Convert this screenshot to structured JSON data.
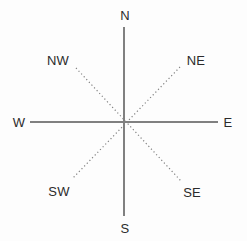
{
  "figure": {
    "name": "compass-rose",
    "background_color": "#fdfdfd",
    "line_color": "#808080",
    "label_color": "#2b2b2b",
    "width": 247,
    "height": 241,
    "center": {
      "x": 124,
      "y": 122
    }
  },
  "axes": [
    {
      "id": "north-south-axis",
      "style": "solid",
      "color": "#808080",
      "width": 1,
      "x1": 124,
      "y1": 27,
      "x2": 124,
      "y2": 216
    },
    {
      "id": "west-east-axis",
      "style": "solid",
      "color": "#808080",
      "width": 1,
      "x1": 30,
      "y1": 122,
      "x2": 218,
      "y2": 122
    },
    {
      "id": "northwest-southeast-axis",
      "style": "dotted",
      "color": "#808080",
      "width": 1,
      "x1": 76,
      "y1": 68,
      "x2": 181,
      "y2": 181
    },
    {
      "id": "northeast-southwest-axis",
      "style": "dotted",
      "color": "#808080",
      "width": 1,
      "x1": 180,
      "y1": 67,
      "x2": 72,
      "y2": 179
    }
  ],
  "labels": {
    "n": {
      "text": "N",
      "x": 125,
      "y": 15,
      "full": "North"
    },
    "nw": {
      "text": "NW",
      "x": 58,
      "y": 60,
      "full": "Northwest"
    },
    "ne": {
      "text": "NE",
      "x": 196,
      "y": 60,
      "full": "Northeast"
    },
    "w": {
      "text": "W",
      "x": 19,
      "y": 122,
      "full": "West"
    },
    "e": {
      "text": "E",
      "x": 228,
      "y": 122,
      "full": "East"
    },
    "sw": {
      "text": "SW",
      "x": 59,
      "y": 191,
      "full": "Southwest"
    },
    "se": {
      "text": "SE",
      "x": 192,
      "y": 192,
      "full": "Southeast"
    },
    "s": {
      "text": "S",
      "x": 125,
      "y": 228,
      "full": "South"
    }
  }
}
